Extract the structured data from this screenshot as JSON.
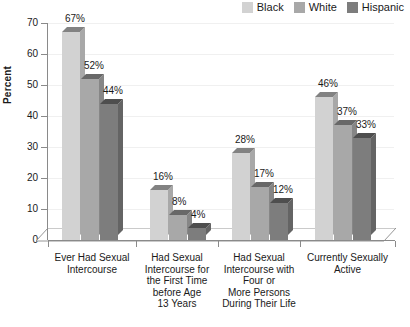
{
  "chart_data": {
    "type": "bar",
    "title": "",
    "xlabel": "",
    "ylabel": "Percent",
    "ylim": [
      0,
      70
    ],
    "ytick_values": [
      0,
      10,
      20,
      30,
      40,
      50,
      60,
      70
    ],
    "ytick_labels": [
      "0",
      "10",
      "20",
      "30",
      "40",
      "50",
      "60",
      "70"
    ],
    "grid": true,
    "legend_position": "top-right",
    "value_suffix": "%",
    "categories": [
      "Ever Had Sexual Intercourse",
      "Had Sexual Intercourse for the First Time before Age 13 Years",
      "Had Sexual Intercourse with Four or More Persons During Their Life",
      "Currently Sexually Active"
    ],
    "category_lines": [
      [
        "Ever Had Sexual",
        "Intercourse"
      ],
      [
        "Had Sexual",
        "Intercourse for",
        "the First Time",
        "before Age",
        "13 Years"
      ],
      [
        "Had Sexual",
        "Intercourse with",
        "Four or",
        "More Persons",
        "During Their Life"
      ],
      [
        "Currently Sexually",
        "Active"
      ]
    ],
    "series": [
      {
        "name": "Black",
        "color": "#d2d2d2",
        "values": [
          67,
          16,
          28,
          46
        ],
        "labels": [
          "67%",
          "16%",
          "28%",
          "46%"
        ]
      },
      {
        "name": "White",
        "color": "#a8a8a8",
        "values": [
          52,
          8,
          17,
          37
        ],
        "labels": [
          "52%",
          "8%",
          "17%",
          "37%"
        ]
      },
      {
        "name": "Hispanic",
        "color": "#7d7d7d",
        "values": [
          44,
          4,
          12,
          33
        ],
        "labels": [
          "44%",
          "4%",
          "12%",
          "33%"
        ]
      }
    ]
  },
  "legend": {
    "items": [
      {
        "label": "Black",
        "color": "#d2d2d2"
      },
      {
        "label": "White",
        "color": "#a8a8a8"
      },
      {
        "label": "Hispanic",
        "color": "#7d7d7d"
      }
    ]
  },
  "axis": {
    "y_title": "Percent"
  },
  "colors": {
    "axis_line": "#8a8a8a",
    "gridline": "#f0f0f0",
    "text": "#1a1a1a",
    "background": "#ffffff",
    "floor": "#ffffff"
  }
}
